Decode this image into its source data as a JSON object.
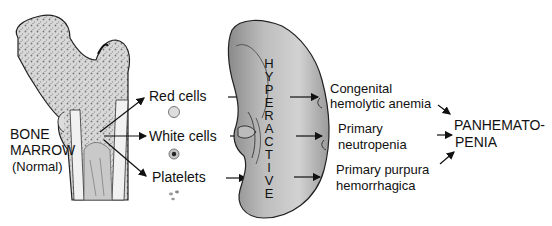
{
  "bone": {
    "label_line1": "BONE",
    "label_line2": "MARROW",
    "label_line3": "(Normal)"
  },
  "cells": [
    {
      "label": "Red cells",
      "icon": "red-cell-icon"
    },
    {
      "label": "White cells",
      "icon": "white-cell-icon"
    },
    {
      "label": "Platelets",
      "icon": "platelets-icon"
    }
  ],
  "spleen": {
    "vertical_label": [
      "H",
      "Y",
      "P",
      "E",
      "R",
      "A",
      "C",
      "T",
      "I",
      "V",
      "E"
    ]
  },
  "conditions": [
    {
      "line1": "Congenital",
      "line2": "hemolytic anemia"
    },
    {
      "line1": "Primary",
      "line2": "neutropenia"
    },
    {
      "line1": "Primary purpura",
      "line2": "hemorrhagica"
    }
  ],
  "result": {
    "line1": "PANHEMATO-",
    "line2": "PENIA"
  }
}
